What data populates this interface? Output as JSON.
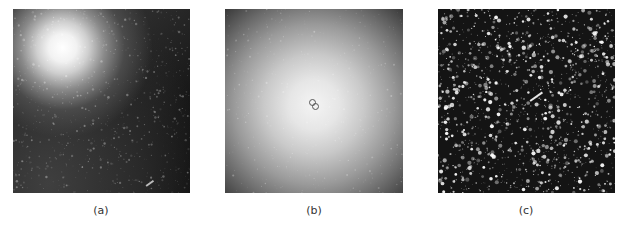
{
  "figure": {
    "panels": [
      {
        "id": "a",
        "label": "(a)",
        "description": "Galaxy field with bright diffuse nucleus at upper left and faint star field; small streak marker near lower right"
      },
      {
        "id": "b",
        "label": "(b)",
        "description": "Bright diffuse glow centered in frame with a small double-circle marker at center"
      },
      {
        "id": "c",
        "label": "(c)",
        "description": "Dense resolved star field with a short streak marker near center"
      }
    ]
  }
}
